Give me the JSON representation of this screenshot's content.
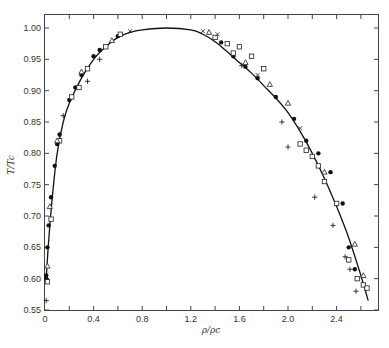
{
  "chart_data": {
    "type": "scatter",
    "title": "",
    "xlabel": "ρ/ρc",
    "ylabel": "T/Tc",
    "xlim": [
      0,
      2.75
    ],
    "ylim": [
      0.55,
      1.02
    ],
    "grid": false,
    "legend": null,
    "x_ticks": [
      0,
      0.4,
      0.8,
      1.2,
      1.6,
      2.0,
      2.4
    ],
    "x_tick_labels": [
      "0",
      "0.4",
      "0.8",
      "1.2",
      "1.6",
      "2.0",
      "2.4"
    ],
    "y_ticks": [
      0.55,
      0.6,
      0.65,
      0.7,
      0.75,
      0.8,
      0.85,
      0.9,
      0.95,
      1.0
    ],
    "y_tick_labels": [
      "0.55",
      "0.60",
      "0.65",
      "0.70",
      "0.75",
      "0.80",
      "0.85",
      "0.90",
      "0.95",
      "1.00"
    ],
    "curve": {
      "name": "coexistence curve",
      "x": [
        0.01,
        0.03,
        0.06,
        0.1,
        0.15,
        0.2,
        0.3,
        0.4,
        0.5,
        0.6,
        0.7,
        0.8,
        1.0,
        1.2,
        1.3,
        1.4,
        1.5,
        1.6,
        1.7,
        1.8,
        1.9,
        2.0,
        2.1,
        2.2,
        2.3,
        2.4,
        2.5,
        2.6,
        2.66
      ],
      "y": [
        0.6,
        0.66,
        0.73,
        0.8,
        0.85,
        0.88,
        0.92,
        0.95,
        0.97,
        0.985,
        0.993,
        0.997,
        1.0,
        0.997,
        0.99,
        0.978,
        0.962,
        0.945,
        0.928,
        0.908,
        0.888,
        0.865,
        0.835,
        0.8,
        0.76,
        0.715,
        0.665,
        0.605,
        0.565
      ]
    },
    "series": [
      {
        "name": "filled circles",
        "marker": "filled-circle",
        "x": [
          0.01,
          0.01,
          0.02,
          0.03,
          0.05,
          0.08,
          0.1,
          0.12,
          0.2,
          0.25,
          0.3,
          0.4,
          0.45,
          0.6,
          1.45,
          1.55,
          1.65,
          1.75,
          1.9,
          2.05,
          2.15,
          2.25,
          2.35,
          2.45,
          2.5,
          2.55
        ],
        "y": [
          0.6,
          0.605,
          0.65,
          0.685,
          0.73,
          0.78,
          0.815,
          0.83,
          0.885,
          0.905,
          0.925,
          0.955,
          0.965,
          0.987,
          0.977,
          0.955,
          0.938,
          0.92,
          0.89,
          0.855,
          0.82,
          0.8,
          0.77,
          0.72,
          0.65,
          0.615
        ]
      },
      {
        "name": "open squares",
        "marker": "open-square",
        "x": [
          0.02,
          0.05,
          0.12,
          0.22,
          0.28,
          0.35,
          0.5,
          0.62,
          1.4,
          1.5,
          1.55,
          1.6,
          1.7,
          1.8,
          2.1,
          2.15,
          2.2,
          2.25,
          2.3,
          2.4,
          2.5,
          2.57,
          2.62,
          2.65
        ],
        "y": [
          0.595,
          0.695,
          0.82,
          0.89,
          0.905,
          0.935,
          0.97,
          0.99,
          0.985,
          0.975,
          0.96,
          0.97,
          0.955,
          0.935,
          0.815,
          0.805,
          0.795,
          0.78,
          0.755,
          0.72,
          0.63,
          0.6,
          0.59,
          0.585
        ]
      },
      {
        "name": "open triangles",
        "marker": "open-triangle",
        "x": [
          0.02,
          0.04,
          0.1,
          0.3,
          0.55,
          1.35,
          1.65,
          1.85,
          2.0,
          2.3,
          2.55,
          2.62
        ],
        "y": [
          0.62,
          0.715,
          0.82,
          0.93,
          0.98,
          0.993,
          0.945,
          0.91,
          0.88,
          0.77,
          0.655,
          0.605
        ]
      },
      {
        "name": "plus",
        "marker": "plus",
        "x": [
          0.01,
          0.15,
          0.35,
          0.45,
          1.62,
          1.95,
          2.0,
          2.22,
          2.37,
          2.47,
          2.51,
          2.56
        ],
        "y": [
          0.565,
          0.86,
          0.915,
          0.95,
          0.94,
          0.85,
          0.81,
          0.73,
          0.685,
          0.635,
          0.615,
          0.58
        ]
      },
      {
        "name": "crosses",
        "marker": "x",
        "x": [
          0.7,
          1.3,
          1.42,
          1.75,
          2.1
        ],
        "y": [
          0.995,
          0.995,
          0.99,
          0.925,
          0.84
        ]
      }
    ]
  }
}
